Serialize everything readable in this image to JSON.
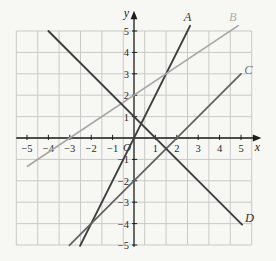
{
  "chart_data": {
    "type": "line",
    "title": "",
    "xlabel": "x",
    "ylabel": "y",
    "origin_label": "O",
    "xlim": [
      -5.5,
      5.5
    ],
    "ylim": [
      -5,
      5
    ],
    "x_ticks": [
      -5,
      -4,
      -3,
      -2,
      -1,
      1,
      2,
      3,
      4,
      5
    ],
    "y_ticks": [
      -5,
      -4,
      -3,
      -2,
      -1,
      1,
      2,
      3,
      4,
      5
    ],
    "grid": true,
    "legend_position": "labels-at-line-ends",
    "series": [
      {
        "label": "A",
        "slope": 2,
        "y_intercept": 0,
        "x_range": [
          -2.52,
          2.62
        ],
        "points": [
          [
            -2,
            -4
          ],
          [
            0,
            0
          ],
          [
            1,
            2
          ],
          [
            2,
            4
          ]
        ],
        "color": "#3e3e3e",
        "width": 1.9,
        "label_pos": [
          2.5,
          5.65
        ],
        "label_color": "#3a3a3a"
      },
      {
        "label": "B",
        "slope": 0.667,
        "y_intercept": 2,
        "x_range": [
          -4.98,
          4.87
        ],
        "points": [
          [
            -3,
            0
          ],
          [
            0,
            2
          ],
          [
            3,
            4
          ]
        ],
        "color": "#a6a6a6",
        "width": 1.6,
        "label_pos": [
          4.62,
          5.65
        ],
        "label_color": "#aeaeae"
      },
      {
        "label": "C",
        "slope": 1,
        "y_intercept": -2,
        "x_range": [
          -3.02,
          5.0
        ],
        "points": [
          [
            -2,
            -4
          ],
          [
            0,
            -2
          ],
          [
            2,
            0
          ],
          [
            5,
            3
          ]
        ],
        "color": "#616161",
        "width": 1.7,
        "label_pos": [
          5.35,
          3.2
        ],
        "label_color": "#757575"
      },
      {
        "label": "D",
        "slope": -1,
        "y_intercept": 1,
        "x_range": [
          -4.0,
          5.05
        ],
        "points": [
          [
            -4,
            5
          ],
          [
            0,
            1
          ],
          [
            1,
            0
          ],
          [
            5,
            -4
          ]
        ],
        "color": "#3e3e3e",
        "width": 1.9,
        "label_pos": [
          5.4,
          -3.72
        ],
        "label_color": "#333333"
      }
    ]
  },
  "colors": {
    "background": "#f7f7f4",
    "grid_line": "#c9c9c9",
    "axis": "#1c1c1c",
    "tick_label": "#2b2b2b"
  }
}
